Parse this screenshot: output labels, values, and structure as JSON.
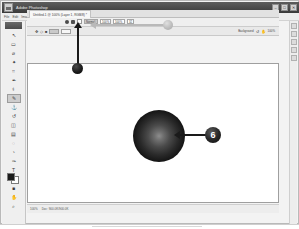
{
  "window": {
    "title": "Adobe Photoshop",
    "app_icon": "photoshop-app-icon",
    "controls": [
      {
        "name": "minimize-button",
        "glyph": "–"
      },
      {
        "name": "maximize-button",
        "glyph": "□"
      },
      {
        "name": "close-button",
        "glyph": "✕"
      }
    ]
  },
  "menubar": {
    "items": [
      {
        "label": "File"
      },
      {
        "label": "Edit"
      },
      {
        "label": "Image"
      },
      {
        "label": "Layer"
      },
      {
        "label": "Select"
      },
      {
        "label": "Filter"
      },
      {
        "label": "View"
      },
      {
        "label": "Window"
      },
      {
        "label": "Help"
      }
    ]
  },
  "document_tab": {
    "label": "Untitled-1 @ 100% (Layer 1, RGB/8) *",
    "close_glyph": "✕"
  },
  "options_bar": {
    "icons": [
      {
        "name": "brush-preset-icon",
        "glyph": "●"
      },
      {
        "name": "lock-icon",
        "glyph": "■"
      },
      {
        "name": "airbrush-icon",
        "glyph": "□"
      }
    ],
    "mode_label": "Mode:",
    "mode_value": "Normal",
    "opacity_label": "Opacity:",
    "opacity_value": "100%",
    "flow_label": "Flow:",
    "flow_value": "100%",
    "tolerance_value": "32"
  },
  "palette_row": {
    "left_icons": [
      {
        "name": "move-tool-icon",
        "glyph": "✥"
      },
      {
        "name": "shape-icon",
        "glyph": "◇"
      },
      {
        "name": "fill-icon",
        "glyph": "■"
      }
    ],
    "style_label": "Style:",
    "style_value": "Normal",
    "align_icons": [
      {
        "name": "align-left-icon",
        "glyph": "≡"
      },
      {
        "name": "align-center-icon",
        "glyph": "≡"
      },
      {
        "name": "align-right-icon",
        "glyph": "≡"
      }
    ],
    "font_size_value": "12.67px",
    "kerning_value": "0.00",
    "layer_label": "Background",
    "zoom_value": "100%",
    "right_icons": [
      {
        "name": "rotate-view-icon",
        "glyph": "↺"
      },
      {
        "name": "hand-tool-icon",
        "glyph": "✋"
      }
    ]
  },
  "toolbar": {
    "tools": [
      {
        "name": "tool-move",
        "glyph": "↖",
        "active": false
      },
      {
        "name": "tool-marquee",
        "glyph": "▭",
        "active": false
      },
      {
        "name": "tool-lasso",
        "glyph": "⌀",
        "active": false
      },
      {
        "name": "tool-magic-wand",
        "glyph": "✦",
        "active": false
      },
      {
        "name": "tool-crop",
        "glyph": "⌗",
        "active": false
      },
      {
        "name": "tool-eyedropper",
        "glyph": "✒",
        "active": false
      },
      {
        "name": "tool-healing-brush",
        "glyph": "⚕",
        "active": false
      },
      {
        "name": "tool-brush",
        "glyph": "✎",
        "active": true
      },
      {
        "name": "tool-clone-stamp",
        "glyph": "⚓",
        "active": false
      },
      {
        "name": "tool-history-brush",
        "glyph": "↺",
        "active": false
      },
      {
        "name": "tool-eraser",
        "glyph": "◫",
        "active": false
      },
      {
        "name": "tool-gradient",
        "glyph": "▤",
        "active": false
      },
      {
        "name": "tool-blur",
        "glyph": "◌",
        "active": false
      },
      {
        "name": "tool-dodge",
        "glyph": "◔",
        "active": false
      },
      {
        "name": "tool-pen",
        "glyph": "✑",
        "active": false
      },
      {
        "name": "tool-type",
        "glyph": "T",
        "active": false
      },
      {
        "name": "tool-path-select",
        "glyph": "▷",
        "active": false
      },
      {
        "name": "tool-shape",
        "glyph": "■",
        "active": false
      },
      {
        "name": "tool-hand",
        "glyph": "✋",
        "active": false
      },
      {
        "name": "tool-zoom",
        "glyph": "⌕",
        "active": false
      }
    ],
    "foreground_color": "#1b1b1b",
    "background_color": "#ffffff"
  },
  "dock": {
    "buttons": [
      {
        "name": "panel-color-button"
      },
      {
        "name": "panel-adjustments-button"
      },
      {
        "name": "panel-layers-button"
      },
      {
        "name": "panel-history-button"
      },
      {
        "name": "panel-swatches-button"
      }
    ]
  },
  "canvas": {
    "artwork": {
      "name": "radial-gradient-sphere",
      "shape": "circle",
      "center_color": "#8d8d8d",
      "edge_color": "#000000"
    }
  },
  "annotations": {
    "step_badge": {
      "number": "6",
      "color": "#111111",
      "text_color": "#ffffff"
    },
    "arrow_to_sphere": {
      "name": "callout-arrow-left",
      "color": "#1a1a1a",
      "direction": "left"
    },
    "arrow_to_toolbar": {
      "name": "callout-arrow-up",
      "color": "#1a1a1a",
      "direction": "up"
    },
    "arrow_gray": {
      "name": "callout-arrow-gray-left",
      "color": "#b9b9b9",
      "direction": "left"
    }
  },
  "statusbar": {
    "zoom": "100%",
    "doc_size": "Doc: 900.0K/900.0K"
  }
}
